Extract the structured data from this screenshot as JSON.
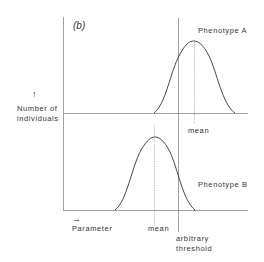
{
  "figure": {
    "panel_label": "(b)",
    "y_axis_arrow": "↑",
    "y_axis_label_line1": "Number of",
    "y_axis_label_line2": "individuals",
    "x_axis_arrow": "→",
    "x_axis_label": "Parameter",
    "threshold_label_line1": "arbitrary",
    "threshold_label_line2": "threshold",
    "top_curve": {
      "name": "Phenotype A",
      "mean_label": "mean"
    },
    "bottom_curve": {
      "name": "Phenotype B",
      "mean_label": "mean"
    },
    "line_color": "#555555"
  }
}
